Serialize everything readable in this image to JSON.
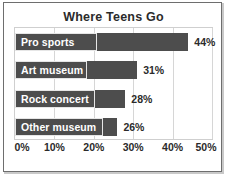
{
  "chart_data": {
    "type": "bar",
    "orientation": "horizontal",
    "title": "Where Teens Go",
    "xlabel": "",
    "ylabel": "",
    "categories": [
      "Pro sports",
      "Art museum",
      "Rock concert",
      "Other museum"
    ],
    "values": [
      44,
      31,
      28,
      26
    ],
    "value_labels": [
      "44%",
      "31%",
      "28%",
      "26%"
    ],
    "xlim": [
      0,
      50
    ],
    "xticks": [
      0,
      10,
      20,
      30,
      40,
      50
    ],
    "xtick_labels": [
      "0%",
      "10%",
      "20%",
      "30%",
      "40%",
      "50%"
    ],
    "grid": true,
    "grid_axis": "x",
    "legend": false,
    "legend_position": "none",
    "colors": {
      "bar": "#4d4d4d",
      "bar_label_text": "#ffffff",
      "value_label_text": "#2b2b2b",
      "title_text": "#2b2b2b",
      "gridline": "#d6d6d6",
      "plot_border": "#cfcfcf",
      "frame_border": "#6e6e6e",
      "background": "#ffffff"
    }
  }
}
